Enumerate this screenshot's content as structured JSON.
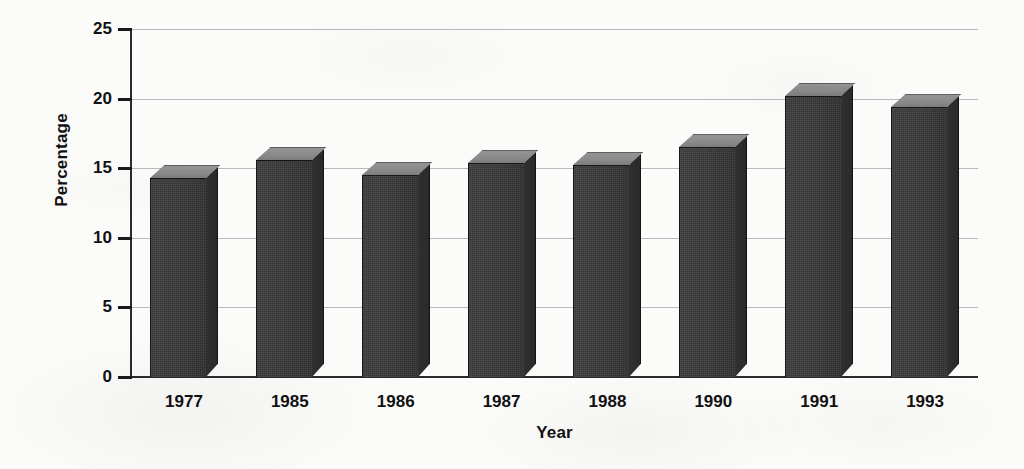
{
  "chart_data": {
    "type": "bar",
    "title": "",
    "subtitle": "",
    "xlabel": "Year",
    "ylabel": "Percentage",
    "categories": [
      "1977",
      "1985",
      "1986",
      "1987",
      "1988",
      "1990",
      "1991",
      "1993"
    ],
    "values": [
      14.3,
      15.6,
      14.5,
      15.4,
      15.2,
      16.5,
      20.2,
      19.4
    ],
    "series": [
      {
        "name": "Percentage",
        "values": [
          14.3,
          15.6,
          14.5,
          15.4,
          15.2,
          16.5,
          20.2,
          19.4
        ]
      }
    ],
    "ylim": [
      0,
      25
    ],
    "ytick_labels": [
      "0",
      "5",
      "10",
      "15",
      "20",
      "25"
    ],
    "ytick_values": [
      0,
      5,
      10,
      15,
      20,
      25
    ],
    "grid": true,
    "legend": false,
    "legend_position": "none",
    "style": "3d-bars",
    "annotations": []
  },
  "colors": {
    "background": "#fbfbf9",
    "bar_front": "#3a3a3a",
    "bar_top": "#8a8a8a",
    "bar_side": "#2a2a2a",
    "gridline": "#b9b9b9",
    "axis": "#2b2b2b",
    "text": "#111111"
  }
}
